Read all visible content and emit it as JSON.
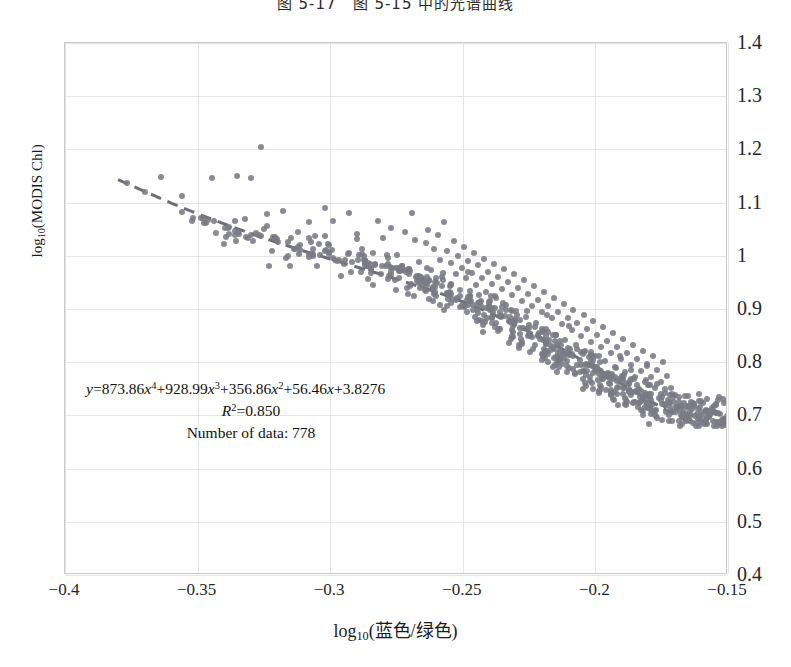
{
  "caption": "图 5-17　图 5-15 中的光谱曲线",
  "chart_data": {
    "type": "scatter",
    "title": "",
    "xlabel": "log10(蓝色/绿色)",
    "ylabel": "log10(MODIS Chl)",
    "xlim": [
      -0.4,
      -0.15
    ],
    "ylim": [
      0.4,
      1.4
    ],
    "xticks": [
      "-0.4",
      "-0.35",
      "-0.3",
      "-0.25",
      "-0.2",
      "-0.15"
    ],
    "xtick_values": [
      -0.4,
      -0.35,
      -0.3,
      -0.25,
      -0.2,
      -0.15
    ],
    "yticks": [
      "0.4",
      "0.5",
      "0.6",
      "0.7",
      "0.8",
      "0.9",
      "1",
      "1.1",
      "1.2",
      "1.3",
      "1.4"
    ],
    "ytick_values": [
      0.4,
      0.5,
      0.6,
      0.7,
      0.8,
      0.9,
      1.0,
      1.1,
      1.2,
      1.3,
      1.4
    ],
    "ytick_side": "right",
    "grid": true,
    "legend": "none",
    "point_color": "#7a7a85",
    "trendline_color": "#6e6e78",
    "trendline_style": "dashed",
    "n_points": 778,
    "r_squared": 0.85,
    "fit_coefficients": [
      873.86,
      928.99,
      356.86,
      56.46,
      3.8276
    ],
    "fit_degree": 4,
    "annotation": {
      "equation_prefix": "y",
      "equation": "=873.86x⁴+928.99x³+356.86x²+56.46x+3.8276",
      "r2_label": "R",
      "r2_sup": "2",
      "r2_value": "=0.850",
      "n_label": "Number of data: 778"
    },
    "points": [
      [
        -0.3765,
        1.137
      ],
      [
        -0.37,
        1.12
      ],
      [
        -0.364,
        1.148
      ],
      [
        -0.356,
        1.113
      ],
      [
        -0.352,
        1.065
      ],
      [
        -0.3445,
        1.146
      ],
      [
        -0.34,
        1.023
      ],
      [
        -0.335,
        1.15
      ],
      [
        -0.332,
        1.07
      ],
      [
        -0.33,
        1.146
      ],
      [
        -0.326,
        1.205
      ],
      [
        -0.323,
        0.98
      ],
      [
        -0.318,
        1.085
      ],
      [
        -0.315,
        0.98
      ],
      [
        -0.312,
        1.044
      ],
      [
        -0.308,
        1.063
      ],
      [
        -0.305,
        0.98
      ],
      [
        -0.302,
        1.09
      ],
      [
        -0.299,
        1.065
      ],
      [
        -0.296,
        0.962
      ],
      [
        -0.293,
        1.081
      ],
      [
        -0.29,
        1.042
      ],
      [
        -0.288,
        1.003
      ],
      [
        -0.286,
        0.98
      ],
      [
        -0.284,
        0.946
      ],
      [
        -0.282,
        1.065
      ],
      [
        -0.28,
        1.033
      ],
      [
        -0.279,
        0.98
      ],
      [
        -0.277,
        1.052
      ],
      [
        -0.275,
        1.002
      ],
      [
        -0.273,
        0.98
      ],
      [
        -0.272,
        1.044
      ],
      [
        -0.27,
        0.972
      ],
      [
        -0.269,
        1.081
      ],
      [
        -0.268,
        1.029
      ],
      [
        -0.2665,
        0.988
      ],
      [
        -0.265,
        0.956
      ],
      [
        -0.264,
        1.024
      ],
      [
        -0.263,
        1.048
      ],
      [
        -0.262,
        0.973
      ],
      [
        -0.261,
        1.012
      ],
      [
        -0.26,
        0.958
      ],
      [
        -0.2595,
        1.039
      ],
      [
        -0.2585,
        0.992
      ],
      [
        -0.2575,
        0.968
      ],
      [
        -0.257,
        1.064
      ],
      [
        -0.256,
        1.01
      ],
      [
        -0.255,
        0.943
      ],
      [
        -0.2545,
        0.987
      ],
      [
        -0.2535,
        1.028
      ],
      [
        -0.2525,
        0.966
      ],
      [
        -0.252,
        1.0
      ],
      [
        -0.251,
        0.935
      ],
      [
        -0.2505,
        0.978
      ],
      [
        -0.2495,
        1.016
      ],
      [
        -0.249,
        0.959
      ],
      [
        -0.248,
        0.99
      ],
      [
        -0.2472,
        0.924
      ],
      [
        -0.2465,
        0.968
      ],
      [
        -0.2458,
        1.005
      ],
      [
        -0.245,
        0.945
      ],
      [
        -0.2443,
        0.982
      ],
      [
        -0.2435,
        0.913
      ],
      [
        -0.2428,
        0.958
      ],
      [
        -0.242,
        0.995
      ],
      [
        -0.2412,
        0.932
      ],
      [
        -0.2405,
        0.97
      ],
      [
        -0.2398,
        0.898
      ],
      [
        -0.239,
        0.948
      ],
      [
        -0.2383,
        0.985
      ],
      [
        -0.2375,
        0.92
      ],
      [
        -0.2368,
        0.96
      ],
      [
        -0.236,
        0.887
      ],
      [
        -0.2353,
        0.938
      ],
      [
        -0.2345,
        0.976
      ],
      [
        -0.2338,
        0.908
      ],
      [
        -0.233,
        0.95
      ],
      [
        -0.2323,
        0.876
      ],
      [
        -0.2315,
        0.927
      ],
      [
        -0.2308,
        0.965
      ],
      [
        -0.23,
        0.896
      ],
      [
        -0.2293,
        0.939
      ],
      [
        -0.2285,
        0.865
      ],
      [
        -0.2278,
        0.916
      ],
      [
        -0.227,
        0.954
      ],
      [
        -0.2263,
        0.885
      ],
      [
        -0.2255,
        0.928
      ],
      [
        -0.2248,
        0.854
      ],
      [
        -0.224,
        0.905
      ],
      [
        -0.2233,
        0.943
      ],
      [
        -0.2225,
        0.874
      ],
      [
        -0.2218,
        0.917
      ],
      [
        -0.221,
        0.843
      ],
      [
        -0.2203,
        0.894
      ],
      [
        -0.2195,
        0.932
      ],
      [
        -0.2188,
        0.863
      ],
      [
        -0.218,
        0.906
      ],
      [
        -0.2173,
        0.833
      ],
      [
        -0.2165,
        0.883
      ],
      [
        -0.2158,
        0.921
      ],
      [
        -0.215,
        0.852
      ],
      [
        -0.2143,
        0.895
      ],
      [
        -0.2135,
        0.823
      ],
      [
        -0.2128,
        0.872
      ],
      [
        -0.212,
        0.91
      ],
      [
        -0.2113,
        0.842
      ],
      [
        -0.2105,
        0.884
      ],
      [
        -0.2098,
        0.813
      ],
      [
        -0.209,
        0.861
      ],
      [
        -0.2083,
        0.899
      ],
      [
        -0.2075,
        0.832
      ],
      [
        -0.2068,
        0.873
      ],
      [
        -0.206,
        0.804
      ],
      [
        -0.2053,
        0.85
      ],
      [
        -0.2045,
        0.888
      ],
      [
        -0.2038,
        0.822
      ],
      [
        -0.203,
        0.862
      ],
      [
        -0.2023,
        0.795
      ],
      [
        -0.2015,
        0.839
      ],
      [
        -0.2008,
        0.877
      ],
      [
        -0.2,
        0.812
      ],
      [
        -0.1993,
        0.851
      ],
      [
        -0.1985,
        0.786
      ],
      [
        -0.1978,
        0.828
      ],
      [
        -0.197,
        0.866
      ],
      [
        -0.1963,
        0.802
      ],
      [
        -0.1955,
        0.84
      ],
      [
        -0.1948,
        0.777
      ],
      [
        -0.194,
        0.817
      ],
      [
        -0.1933,
        0.855
      ],
      [
        -0.1925,
        0.792
      ],
      [
        -0.1918,
        0.829
      ],
      [
        -0.191,
        0.768
      ],
      [
        -0.1903,
        0.806
      ],
      [
        -0.1895,
        0.844
      ],
      [
        -0.1888,
        0.782
      ],
      [
        -0.188,
        0.818
      ],
      [
        -0.1873,
        0.759
      ],
      [
        -0.1865,
        0.795
      ],
      [
        -0.1858,
        0.833
      ],
      [
        -0.185,
        0.772
      ],
      [
        -0.1843,
        0.807
      ],
      [
        -0.1835,
        0.75
      ],
      [
        -0.1828,
        0.784
      ],
      [
        -0.182,
        0.822
      ],
      [
        -0.1813,
        0.762
      ],
      [
        -0.1805,
        0.796
      ],
      [
        -0.1798,
        0.741
      ],
      [
        -0.179,
        0.773
      ],
      [
        -0.1783,
        0.811
      ],
      [
        -0.1775,
        0.752
      ],
      [
        -0.1768,
        0.785
      ],
      [
        -0.176,
        0.732
      ],
      [
        -0.1753,
        0.762
      ],
      [
        -0.1745,
        0.8
      ],
      [
        -0.1738,
        0.742
      ],
      [
        -0.173,
        0.774
      ],
      [
        -0.1723,
        0.723
      ],
      [
        -0.1715,
        0.751
      ],
      [
        -0.1708,
        0.706
      ],
      [
        -0.17,
        0.738
      ],
      [
        -0.1693,
        0.715
      ],
      [
        -0.1685,
        0.725
      ],
      [
        -0.167,
        0.702
      ]
    ],
    "trendline_points": [
      [
        -0.38,
        1.143
      ],
      [
        -0.37,
        1.121
      ],
      [
        -0.36,
        1.099
      ],
      [
        -0.35,
        1.079
      ],
      [
        -0.34,
        1.06
      ],
      [
        -0.33,
        1.042
      ],
      [
        -0.32,
        1.025
      ],
      [
        -0.31,
        1.009
      ],
      [
        -0.3,
        0.994
      ],
      [
        -0.29,
        0.979
      ],
      [
        -0.28,
        0.964
      ],
      [
        -0.27,
        0.948
      ],
      [
        -0.26,
        0.932
      ],
      [
        -0.25,
        0.914
      ],
      [
        -0.24,
        0.893
      ],
      [
        -0.23,
        0.87
      ],
      [
        -0.22,
        0.845
      ],
      [
        -0.21,
        0.818
      ],
      [
        -0.2,
        0.789
      ],
      [
        -0.19,
        0.759
      ],
      [
        -0.18,
        0.729
      ],
      [
        -0.17,
        0.701
      ],
      [
        -0.165,
        0.688
      ]
    ]
  }
}
